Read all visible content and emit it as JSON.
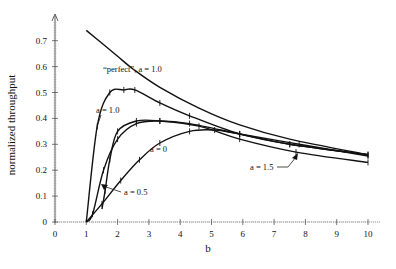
{
  "chart_data": {
    "type": "line",
    "title": "",
    "xlabel": "b",
    "ylabel": "normalized throughput",
    "xlim": [
      0,
      10
    ],
    "ylim": [
      0,
      0.75
    ],
    "xticks": [
      "0",
      "1",
      "2",
      "3",
      "4",
      "5",
      "6",
      "7",
      "8",
      "9",
      "10"
    ],
    "yticks": [
      "0",
      "0.1",
      "0.2",
      "0.3",
      "0.4",
      "0.5",
      "0.6",
      "0.7"
    ],
    "grid": false,
    "legend": "inline annotations",
    "series": [
      {
        "name": "“perfect”, a = 1.0",
        "markers": false,
        "x": [
          1.0,
          1.5,
          2.0,
          2.5,
          3.35,
          4.6,
          5.9,
          7.5,
          10.0
        ],
        "y": [
          0.74,
          0.69,
          0.64,
          0.59,
          0.52,
          0.44,
          0.375,
          0.32,
          0.26
        ]
      },
      {
        "name": "a = 1.0",
        "markers": true,
        "x": [
          1.0,
          1.35,
          1.75,
          2.2,
          2.55,
          3.35,
          4.3,
          5.9,
          7.5,
          10.0
        ],
        "y": [
          0.0,
          0.37,
          0.5,
          0.51,
          0.51,
          0.46,
          0.41,
          0.34,
          0.3,
          0.26
        ]
      },
      {
        "name": "a = 0.5",
        "markers": true,
        "x": [
          1.0,
          1.2,
          1.55,
          2.0,
          2.6,
          3.35,
          4.3,
          5.9,
          7.5,
          10.0
        ],
        "y": [
          0.0,
          0.03,
          0.2,
          0.32,
          0.38,
          0.39,
          0.38,
          0.34,
          0.3,
          0.26
        ]
      },
      {
        "name": "a = 0",
        "markers": true,
        "x": [
          1.0,
          1.5,
          2.1,
          2.7,
          3.35,
          4.3,
          5.1,
          5.9,
          7.8,
          10.0
        ],
        "y": [
          0.0,
          0.07,
          0.16,
          0.24,
          0.305,
          0.35,
          0.355,
          0.34,
          0.3,
          0.255
        ]
      },
      {
        "name": "a = 1.5",
        "markers": true,
        "x": [
          1.5,
          1.6,
          1.75,
          2.0,
          2.6,
          3.35,
          4.6,
          5.9,
          7.7,
          10.0
        ],
        "y": [
          0.05,
          0.12,
          0.24,
          0.35,
          0.39,
          0.39,
          0.37,
          0.32,
          0.27,
          0.23
        ]
      }
    ],
    "annotations": [
      {
        "text": "“perfect”, a = 1.0",
        "x": 1.5,
        "y": 0.6
      },
      {
        "text": "a = 1.0",
        "x": 1.2,
        "y": 0.43
      },
      {
        "text": "a = 0",
        "x": 3.3,
        "y": 0.28
      },
      {
        "text": "a = 0.5",
        "x": 2.2,
        "y": 0.11
      },
      {
        "text": "a = 1.5",
        "x": 6.2,
        "y": 0.21
      }
    ]
  },
  "labels": {
    "xlabel": "b",
    "ylabel": "normalized throughput",
    "perfect": "“perfect”, a = 1.0",
    "a10": "a = 1.0",
    "a0": "a = 0",
    "a05": "a = 0.5",
    "a15": "a = 1.5"
  }
}
